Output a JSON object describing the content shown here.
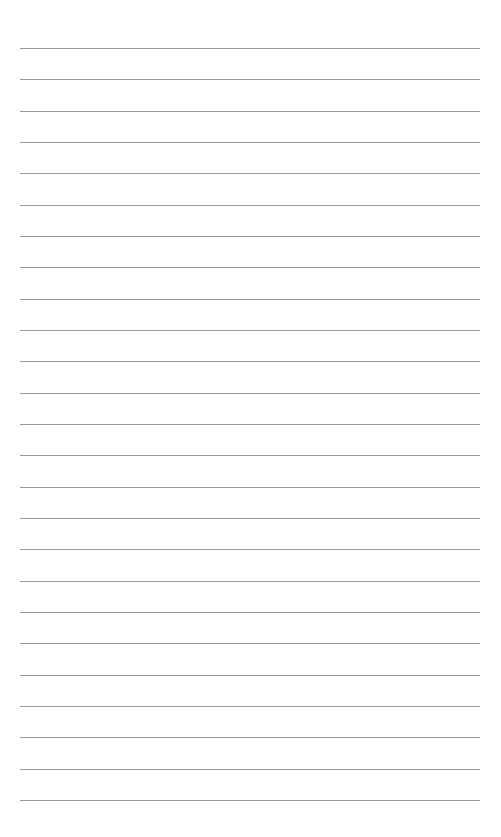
{
  "page": {
    "type": "lined-paper",
    "background_color": "#ffffff",
    "line_color": "#9a9a9a",
    "line_count": 25,
    "first_line_y": 48,
    "line_spacing": 31.33,
    "line_left": 20,
    "line_width": 460
  }
}
